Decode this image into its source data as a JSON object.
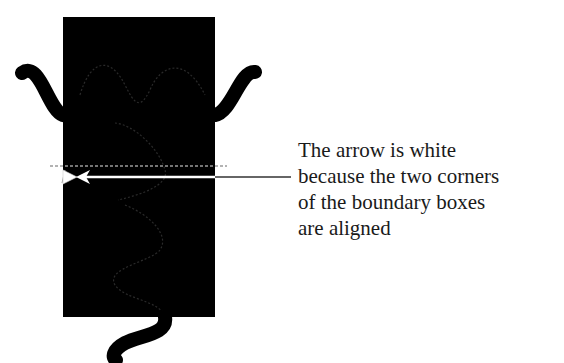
{
  "annotation": {
    "lines": [
      "The arrow is white",
      "because the two corners",
      "of the boundary boxes",
      "are aligned"
    ]
  },
  "colors": {
    "background": "#ffffff",
    "box_fill": "#000000",
    "curve_stroke": "#000000",
    "arrow": "#ffffff",
    "callout_line": "#333333",
    "dashed_guide": "#9a9a9a",
    "text": "#1a1a1a"
  }
}
